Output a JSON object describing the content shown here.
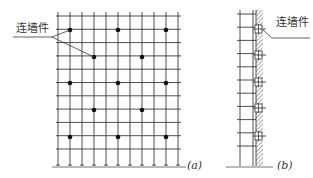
{
  "figure_a": {
    "caption": "(a)",
    "label": "连墙件",
    "grid": {
      "x_lines": [
        58,
        70,
        82,
        94,
        106,
        118,
        130,
        142,
        154,
        166,
        178
      ],
      "y_top": 16,
      "y_step": 13.3,
      "y_count": 11,
      "ground_y": 166
    },
    "ties": [
      {
        "x": 70,
        "y": 30
      },
      {
        "x": 118,
        "y": 30
      },
      {
        "x": 166,
        "y": 30
      },
      {
        "x": 94,
        "y": 57
      },
      {
        "x": 142,
        "y": 57
      },
      {
        "x": 70,
        "y": 83
      },
      {
        "x": 118,
        "y": 83
      },
      {
        "x": 166,
        "y": 83
      },
      {
        "x": 94,
        "y": 110
      },
      {
        "x": 142,
        "y": 110
      },
      {
        "x": 70,
        "y": 137
      },
      {
        "x": 118,
        "y": 137
      },
      {
        "x": 166,
        "y": 137
      }
    ]
  },
  "figure_b": {
    "caption": "(b)",
    "label": "连墙件",
    "ladder": {
      "x_left": 240,
      "x_right": 253,
      "y_top": 14,
      "y_step": 13.2,
      "rungs": 11
    },
    "wall": {
      "x": 256,
      "width": 7,
      "y_top": 10,
      "y_bottom": 166
    },
    "ties_y": [
      29,
      55,
      82,
      108,
      136
    ]
  },
  "colors": {
    "line": "#3a3a3a",
    "text": "#333333"
  }
}
